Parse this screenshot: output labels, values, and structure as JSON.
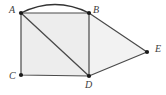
{
  "figure": {
    "background_color": "#ffffff",
    "stroke_color": "#4a4a4a",
    "arc_color": "#333333",
    "vertex_color": "#1a1a1a",
    "square_fill": "#ededed",
    "triangle_fill": "#f2f2f2",
    "label_color": "#3d3d3d"
  },
  "points": {
    "A": {
      "label": "A",
      "x": 21,
      "y": 13,
      "label_x": 9,
      "label_y": 5
    },
    "B": {
      "label": "B",
      "x": 89,
      "y": 13,
      "label_x": 93,
      "label_y": 5
    },
    "C": {
      "label": "C",
      "x": 21,
      "y": 75,
      "label_x": 9,
      "label_y": 71
    },
    "D": {
      "label": "D",
      "x": 89,
      "y": 76,
      "label_x": 85,
      "label_y": 79
    },
    "E": {
      "label": "E",
      "x": 147,
      "y": 52,
      "label_x": 155,
      "label_y": 44
    }
  },
  "shapes": {
    "square": {
      "name": "square-ABDC",
      "path": "M 21 13 L 89 13 L 89 76 L 21 75 Z"
    },
    "triangle": {
      "name": "triangle-BDE",
      "path": "M 89 13 L 147 52 L 89 76 Z"
    },
    "diagonal": {
      "name": "diagonal-AD",
      "x1": 21,
      "y1": 13,
      "x2": 89,
      "y2": 76
    },
    "arc": {
      "name": "arc-AB",
      "path": "M 21 13 Q 55 -4 89 13"
    },
    "segment_BE": {
      "x1": 89,
      "y1": 13,
      "x2": 147,
      "y2": 52
    },
    "segment_DE": {
      "x1": 89,
      "y1": 76,
      "x2": 147,
      "y2": 52
    }
  },
  "vertex_radius": 2.1,
  "stroke_width": 1.2,
  "arc_stroke_width": 1.3
}
